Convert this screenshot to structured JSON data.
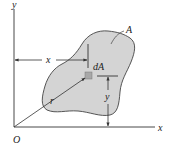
{
  "diagram": {
    "labels": {
      "y_axis": "y",
      "x_axis": "x",
      "origin": "O",
      "area": "A",
      "element": "dA",
      "x_distance": "x",
      "y_distance": "y",
      "radius": "r"
    },
    "colors": {
      "region_fill": "#d4d4d4",
      "element_fill": "#a8a8a8",
      "line": "#333333"
    }
  }
}
